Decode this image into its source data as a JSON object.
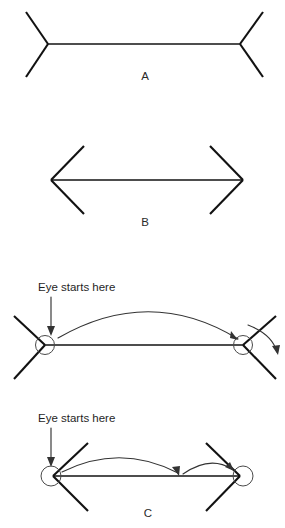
{
  "figure": {
    "title_present": false,
    "background_color": "#ffffff",
    "line_color": "#121212",
    "arc_color": "#333333",
    "circle_color": "#4a4a4a",
    "panels": [
      {
        "id": "A",
        "label": "A",
        "label_x": 145,
        "label_y": 80,
        "description": "Muller-Lyer shaft with outward fins",
        "shaft": {
          "x1": 48,
          "y1": 44,
          "x2": 240,
          "y2": 44
        },
        "fins": [
          {
            "x1": 48,
            "y1": 44,
            "x2": 26,
            "y2": 12
          },
          {
            "x1": 48,
            "y1": 44,
            "x2": 26,
            "y2": 77
          },
          {
            "x1": 240,
            "y1": 44,
            "x2": 263,
            "y2": 12
          },
          {
            "x1": 240,
            "y1": 44,
            "x2": 263,
            "y2": 77
          }
        ]
      },
      {
        "id": "B",
        "label": "B",
        "label_x": 145,
        "label_y": 226,
        "description": "Muller-Lyer shaft with inward fins",
        "shaft": {
          "x1": 51,
          "y1": 180,
          "x2": 243,
          "y2": 180
        },
        "fins": [
          {
            "x1": 51,
            "y1": 180,
            "x2": 84,
            "y2": 146
          },
          {
            "x1": 51,
            "y1": 180,
            "x2": 84,
            "y2": 214
          },
          {
            "x1": 243,
            "y1": 180,
            "x2": 210,
            "y2": 146
          },
          {
            "x1": 243,
            "y1": 180,
            "x2": 210,
            "y2": 214
          }
        ]
      },
      {
        "id": "C",
        "label": "C",
        "label_x": 148,
        "label_y": 517,
        "description": "Eye movement saccades over both Muller-Lyer figures",
        "sub_panels": [
          {
            "id": "C-top",
            "description": "Outward fins: saccade overshoots the vertex",
            "shaft": {
              "x1": 45,
              "y1": 345,
              "x2": 243,
              "y2": 345
            },
            "fins": [
              {
                "x1": 45,
                "y1": 345,
                "x2": 14,
                "y2": 316
              },
              {
                "x1": 45,
                "y1": 345,
                "x2": 14,
                "y2": 379
              },
              {
                "x1": 243,
                "y1": 345,
                "x2": 276,
                "y2": 316
              },
              {
                "x1": 243,
                "y1": 345,
                "x2": 276,
                "y2": 379
              }
            ],
            "fixation_circles": [
              {
                "cx": 45,
                "cy": 345,
                "r": 9.5
              },
              {
                "cx": 243,
                "cy": 345,
                "r": 9.5
              }
            ],
            "callout": {
              "text": "Eye starts here",
              "text_x": 38,
              "text_y": 291,
              "pointer": {
                "x1": 51,
                "y1": 297,
                "x2": 51,
                "y2": 333
              }
            },
            "saccade_arcs": [
              {
                "name": "main-saccade",
                "start": [
                  58,
                  338
                ],
                "end": [
                  238,
                  340
                ],
                "sweep_height": 48
              },
              {
                "name": "overshoot-correction",
                "start": [
                  247,
                  326
                ],
                "end": [
                  277,
                  352
                ],
                "sweep_height": 16
              }
            ]
          },
          {
            "id": "C-bottom",
            "description": "Inward fins: saccade undershoots then corrects",
            "shaft": {
              "x1": 53,
              "y1": 476,
              "x2": 240,
              "y2": 476
            },
            "fins": [
              {
                "x1": 53,
                "y1": 476,
                "x2": 88,
                "y2": 443
              },
              {
                "x1": 53,
                "y1": 476,
                "x2": 88,
                "y2": 511
              },
              {
                "x1": 240,
                "y1": 476,
                "x2": 206,
                "y2": 443
              },
              {
                "x1": 240,
                "y1": 476,
                "x2": 206,
                "y2": 511
              }
            ],
            "fixation_circles": [
              {
                "cx": 51,
                "cy": 476,
                "r": 10
              },
              {
                "cx": 243,
                "cy": 476,
                "r": 10
              }
            ],
            "callout": {
              "text": "Eye starts here",
              "text_x": 38,
              "text_y": 422,
              "pointer": {
                "x1": 51,
                "y1": 428,
                "x2": 51,
                "y2": 464
              }
            },
            "saccade_arcs": [
              {
                "name": "undershoot-saccade",
                "start": [
                  62,
                  473
                ],
                "end": [
                  178,
                  474
                ],
                "sweep_height": 30
              },
              {
                "name": "corrective-saccade",
                "start": [
                  182,
                  474
                ],
                "end": [
                  232,
                  470
                ],
                "sweep_height": 16
              }
            ]
          }
        ]
      }
    ]
  }
}
